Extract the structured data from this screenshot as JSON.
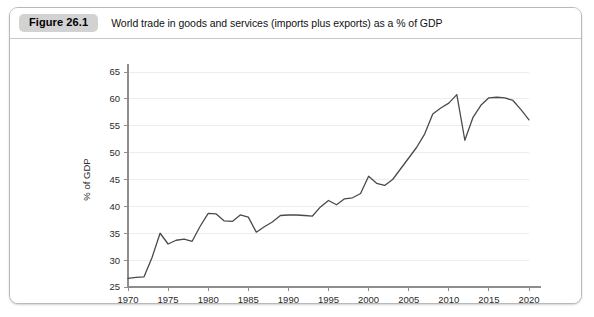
{
  "figure": {
    "badge_label": "Figure 26.1",
    "title": "World trade in goods and services (imports plus exports) as a % of GDP",
    "badge_color": "#d2d2d2",
    "border_color": "#b9b9b9"
  },
  "chart_data": {
    "type": "line",
    "title": "World trade in goods and services (imports plus exports) as a % of GDP",
    "xlabel": "",
    "ylabel": "% of GDP",
    "xlim": [
      1970,
      2020
    ],
    "ylim": [
      25,
      65
    ],
    "xticks": [
      1970,
      1975,
      1980,
      1985,
      1990,
      1995,
      2000,
      2005,
      2010,
      2015,
      2020
    ],
    "yticks": [
      25,
      30,
      35,
      40,
      45,
      50,
      55,
      60,
      65
    ],
    "grid": true,
    "grid_axis": "y",
    "legend": false,
    "line_color": "#4a4a4a",
    "x": [
      1970,
      1971,
      1972,
      1973,
      1974,
      1975,
      1976,
      1977,
      1978,
      1979,
      1980,
      1981,
      1982,
      1983,
      1984,
      1985,
      1986,
      1987,
      1988,
      1989,
      1990,
      1991,
      1992,
      1993,
      1994,
      1995,
      1996,
      1997,
      1998,
      1999,
      2000,
      2001,
      2002,
      2003,
      2004,
      2005,
      2006,
      2007,
      2008,
      2009,
      2010,
      2011,
      2012,
      2013,
      2014,
      2015,
      2016,
      2017,
      2018,
      2019,
      2020
    ],
    "y": [
      26.6,
      26.8,
      26.9,
      30.5,
      35.0,
      33.0,
      33.7,
      33.9,
      33.5,
      36.3,
      38.7,
      38.6,
      37.3,
      37.2,
      38.4,
      38.0,
      35.2,
      36.2,
      37.1,
      38.3,
      38.4,
      38.4,
      38.3,
      38.2,
      39.9,
      41.1,
      40.3,
      41.4,
      41.6,
      42.4,
      45.6,
      44.3,
      43.9,
      45.0,
      47.0,
      49.9,
      50.6,
      51.0,
      52.0,
      50.7,
      51.0,
      52.0,
      51.0,
      50.0,
      49.0,
      48.0,
      47.0,
      46.0,
      45.0,
      44.0,
      43.0
    ],
    "y_actual": [
      26.6,
      26.8,
      26.9,
      30.5,
      35.0,
      33.0,
      33.7,
      33.9,
      33.5,
      36.3,
      38.7,
      38.6,
      37.3,
      37.2,
      38.4,
      38.0,
      35.2,
      36.2,
      37.1,
      38.3,
      38.4,
      38.4,
      38.3,
      38.2,
      39.9,
      41.1,
      40.3,
      41.4,
      41.6,
      42.4,
      45.6,
      44.3,
      43.9,
      45.0,
      47.0,
      49.0,
      51.0,
      53.5,
      57.2,
      58.3,
      59.2,
      60.8,
      52.3,
      56.5,
      58.8,
      60.2,
      60.3,
      60.2,
      59.7,
      58.0,
      56.1,
      57.5,
      59.3,
      58.4,
      53.3
    ]
  },
  "series_points": [
    {
      "year": 1970,
      "value": 26.6
    },
    {
      "year": 1971,
      "value": 26.8
    },
    {
      "year": 1972,
      "value": 26.9
    },
    {
      "year": 1973,
      "value": 30.5
    },
    {
      "year": 1974,
      "value": 35.0
    },
    {
      "year": 1975,
      "value": 33.0
    },
    {
      "year": 1976,
      "value": 33.7
    },
    {
      "year": 1977,
      "value": 33.9
    },
    {
      "year": 1978,
      "value": 33.5
    },
    {
      "year": 1979,
      "value": 36.3
    },
    {
      "year": 1980,
      "value": 38.7
    },
    {
      "year": 1981,
      "value": 38.6
    },
    {
      "year": 1982,
      "value": 37.3
    },
    {
      "year": 1983,
      "value": 37.2
    },
    {
      "year": 1984,
      "value": 38.4
    },
    {
      "year": 1985,
      "value": 38.0
    },
    {
      "year": 1986,
      "value": 35.2
    },
    {
      "year": 1987,
      "value": 36.2
    },
    {
      "year": 1988,
      "value": 37.1
    },
    {
      "year": 1989,
      "value": 38.3
    },
    {
      "year": 1990,
      "value": 38.4
    },
    {
      "year": 1991,
      "value": 38.4
    },
    {
      "year": 1992,
      "value": 38.3
    },
    {
      "year": 1993,
      "value": 38.2
    },
    {
      "year": 1994,
      "value": 39.9
    },
    {
      "year": 1995,
      "value": 41.1
    },
    {
      "year": 1996,
      "value": 40.3
    },
    {
      "year": 1997,
      "value": 41.4
    },
    {
      "year": 1998,
      "value": 41.6
    },
    {
      "year": 1999,
      "value": 42.4
    },
    {
      "year": 2000,
      "value": 45.6
    },
    {
      "year": 2001,
      "value": 44.3
    },
    {
      "year": 2002,
      "value": 43.9
    },
    {
      "year": 2003,
      "value": 45.0
    },
    {
      "year": 2004,
      "value": 47.0
    },
    {
      "year": 2005,
      "value": 49.0
    },
    {
      "year": 2006,
      "value": 51.0
    },
    {
      "year": 2007,
      "value": 53.5
    },
    {
      "year": 2008,
      "value": 57.2
    },
    {
      "year": 2009,
      "value": 58.3
    },
    {
      "year": 2010,
      "value": 59.2
    },
    {
      "year": 2011,
      "value": 60.8
    },
    {
      "year": 2012,
      "value": 52.3
    },
    {
      "year": 2013,
      "value": 56.5
    },
    {
      "year": 2014,
      "value": 58.8
    },
    {
      "year": 2015,
      "value": 60.2
    },
    {
      "year": 2016,
      "value": 60.3
    },
    {
      "year": 2017,
      "value": 60.2
    },
    {
      "year": 2018,
      "value": 59.7
    },
    {
      "year": 2019,
      "value": 58.0
    },
    {
      "year": 2020,
      "value": 56.1
    }
  ]
}
